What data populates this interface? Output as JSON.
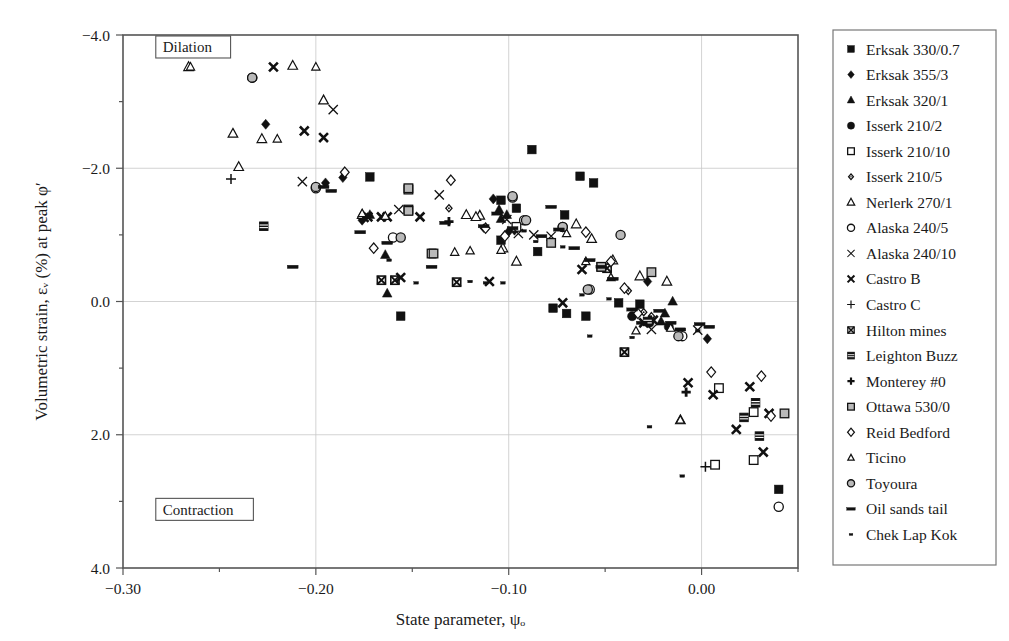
{
  "chart_data": {
    "type": "scatter",
    "title": "",
    "xlabel": "State parameter, ψₒ",
    "ylabel": "Volumetric strain, εᵥ (%) at peak φ′",
    "xlim": [
      -0.3,
      0.05
    ],
    "ylim": [
      -4.0,
      4.0
    ],
    "y_inverted": true,
    "grid": true,
    "legend_position": "right-outside",
    "xticks": [
      -0.3,
      -0.2,
      -0.1,
      0.0
    ],
    "xtick_labels": [
      "−0.30",
      "−0.20",
      "−0.10",
      "0.00"
    ],
    "xminorticks": [
      -0.25,
      -0.15,
      -0.05,
      0.05
    ],
    "yticks": [
      -4.0,
      -2.0,
      0.0,
      2.0,
      4.0
    ],
    "ytick_labels": [
      "−4.0",
      "−2.0",
      "0.0",
      "2.0",
      "4.0"
    ],
    "yminorticks": [
      -3.0,
      -1.0,
      1.0,
      3.0
    ],
    "annotations": [
      {
        "text": "Dilation",
        "x": -0.283,
        "y": -3.82,
        "boxed": true
      },
      {
        "text": "Contraction",
        "x": -0.283,
        "y": 3.12,
        "boxed": true
      }
    ],
    "series": [
      {
        "name": "Erksak 330/0.7",
        "marker": "filled-square",
        "points": [
          [
            -0.172,
            -1.87
          ],
          [
            -0.088,
            -2.28
          ],
          [
            -0.063,
            -1.88
          ],
          [
            -0.056,
            -1.78
          ],
          [
            -0.104,
            -1.52
          ],
          [
            -0.096,
            -1.4
          ],
          [
            -0.071,
            -1.3
          ],
          [
            -0.104,
            -0.92
          ],
          [
            -0.085,
            -0.75
          ],
          [
            -0.077,
            0.1
          ],
          [
            -0.07,
            0.18
          ],
          [
            -0.06,
            0.22
          ],
          [
            -0.043,
            0.02
          ],
          [
            -0.032,
            0.04
          ],
          [
            -0.156,
            0.22
          ],
          [
            0.04,
            2.82
          ]
        ]
      },
      {
        "name": "Erksak 355/3",
        "marker": "filled-diamond",
        "points": [
          [
            -0.226,
            -2.66
          ],
          [
            -0.195,
            -1.78
          ],
          [
            -0.186,
            -1.86
          ],
          [
            -0.176,
            -1.22
          ],
          [
            -0.108,
            -1.54
          ],
          [
            -0.097,
            -1.07
          ],
          [
            -0.028,
            -0.3
          ],
          [
            0.003,
            0.56
          ],
          [
            -0.1,
            -1.05
          ]
        ]
      },
      {
        "name": "Erksak 320/1",
        "marker": "filled-triangle",
        "points": [
          [
            -0.172,
            -1.3
          ],
          [
            -0.164,
            -0.7
          ],
          [
            -0.163,
            -0.12
          ],
          [
            -0.105,
            -1.38
          ],
          [
            -0.104,
            -1.24
          ],
          [
            -0.019,
            0.18
          ],
          [
            -0.015,
            0.0
          ],
          [
            -0.101,
            -1.3
          ],
          [
            -0.021,
            0.3
          ]
        ]
      },
      {
        "name": "Isserk 210/2",
        "marker": "filled-circle",
        "points": [
          [
            -0.036,
            0.22
          ],
          [
            -0.027,
            0.32
          ],
          [
            -0.017,
            0.38
          ]
        ]
      },
      {
        "name": "Isserk 210/10",
        "marker": "open-square",
        "points": [
          [
            -0.152,
            -1.68
          ],
          [
            -0.152,
            -1.38
          ],
          [
            -0.14,
            -0.72
          ],
          [
            -0.096,
            -1.12
          ],
          [
            0.009,
            1.3
          ],
          [
            0.027,
            1.66
          ],
          [
            0.027,
            2.38
          ],
          [
            0.007,
            2.45
          ]
        ]
      },
      {
        "name": "Isserk 210/5",
        "marker": "small-open-diamond",
        "points": [
          [
            -0.17,
            -0.8
          ],
          [
            -0.131,
            -1.4
          ],
          [
            -0.113,
            -1.1
          ],
          [
            -0.102,
            -1.0
          ],
          [
            -0.038,
            -0.16
          ],
          [
            -0.03,
            0.16
          ],
          [
            -0.026,
            0.22
          ]
        ]
      },
      {
        "name": "Nerlerk 270/1",
        "marker": "open-triangle",
        "points": [
          [
            -0.266,
            -3.52
          ],
          [
            -0.243,
            -2.52
          ],
          [
            -0.228,
            -2.44
          ],
          [
            -0.212,
            -3.54
          ],
          [
            -0.196,
            -3.02
          ],
          [
            -0.24,
            -2.02
          ],
          [
            -0.176,
            -1.3
          ],
          [
            -0.122,
            -1.3
          ],
          [
            -0.115,
            -1.29
          ],
          [
            -0.103,
            -0.8
          ],
          [
            -0.096,
            -0.6
          ],
          [
            -0.065,
            -1.16
          ],
          [
            -0.057,
            -0.94
          ],
          [
            -0.046,
            -0.62
          ],
          [
            -0.032,
            -0.38
          ],
          [
            -0.018,
            -0.3
          ],
          [
            -0.011,
            1.78
          ],
          [
            -0.117,
            -1.27
          ]
        ]
      },
      {
        "name": "Alaska 240/5",
        "marker": "open-circle",
        "points": [
          [
            -0.233,
            -3.36
          ],
          [
            -0.2,
            -1.7
          ],
          [
            -0.16,
            -0.96
          ],
          [
            -0.098,
            -1.56
          ],
          [
            -0.092,
            -1.22
          ],
          [
            -0.072,
            -1.12
          ],
          [
            -0.058,
            -0.18
          ],
          [
            -0.01,
            0.52
          ],
          [
            0.04,
            3.08
          ]
        ]
      },
      {
        "name": "Alaska 240/10",
        "marker": "x-thin",
        "points": [
          [
            -0.207,
            -1.8
          ],
          [
            -0.191,
            -2.88
          ],
          [
            -0.157,
            -1.38
          ],
          [
            -0.136,
            -1.6
          ],
          [
            -0.095,
            -1.02
          ],
          [
            -0.087,
            -1.0
          ],
          [
            -0.078,
            -0.98
          ],
          [
            -0.026,
            0.42
          ],
          [
            -0.002,
            0.43
          ],
          [
            -0.101,
            -1.23
          ]
        ]
      },
      {
        "name": "Castro B",
        "marker": "x-bold",
        "points": [
          [
            -0.222,
            -3.52
          ],
          [
            -0.206,
            -2.56
          ],
          [
            -0.196,
            -2.46
          ],
          [
            -0.173,
            -1.27
          ],
          [
            -0.166,
            -1.27
          ],
          [
            -0.163,
            -1.27
          ],
          [
            -0.156,
            -0.36
          ],
          [
            -0.146,
            -1.27
          ],
          [
            -0.11,
            -0.3
          ],
          [
            -0.072,
            0.02
          ],
          [
            -0.062,
            -0.48
          ],
          [
            -0.03,
            0.32
          ],
          [
            -0.025,
            0.28
          ],
          [
            -0.007,
            1.22
          ],
          [
            0.006,
            1.4
          ],
          [
            0.025,
            1.28
          ],
          [
            0.018,
            1.92
          ],
          [
            0.035,
            1.68
          ],
          [
            0.032,
            2.26
          ],
          [
            -0.175,
            -1.26
          ]
        ]
      },
      {
        "name": "Castro C",
        "marker": "plus",
        "points": [
          [
            -0.244,
            -1.84
          ],
          [
            0.002,
            2.48
          ]
        ]
      },
      {
        "name": "Hilton mines",
        "marker": "x-bold-sq",
        "points": [
          [
            -0.166,
            -0.32
          ],
          [
            -0.159,
            -0.32
          ],
          [
            -0.127,
            -0.29
          ],
          [
            -0.052,
            -0.52
          ],
          [
            -0.049,
            -0.5
          ],
          [
            -0.04,
            0.76
          ]
        ]
      },
      {
        "name": "Leighton Buzz",
        "marker": "x-bold-fill",
        "points": [
          [
            -0.227,
            -1.13
          ],
          [
            -0.028,
            0.3
          ],
          [
            0.022,
            1.74
          ],
          [
            0.028,
            1.52
          ],
          [
            0.03,
            2.02
          ]
        ]
      },
      {
        "name": "Monterey #0",
        "marker": "plus-bold",
        "points": [
          [
            -0.131,
            -1.2
          ],
          [
            -0.008,
            1.36
          ]
        ]
      },
      {
        "name": "Ottawa 530/0",
        "marker": "grey-square",
        "points": [
          [
            -0.152,
            -1.7
          ],
          [
            -0.152,
            -1.36
          ],
          [
            -0.139,
            -0.72
          ],
          [
            -0.078,
            -0.88
          ],
          [
            -0.052,
            -0.52
          ],
          [
            -0.026,
            -0.44
          ],
          [
            0.043,
            1.68
          ]
        ]
      },
      {
        "name": "Reid Bedford",
        "marker": "open-diamond",
        "points": [
          [
            -0.185,
            -1.94
          ],
          [
            -0.17,
            -0.8
          ],
          [
            -0.13,
            -1.82
          ],
          [
            -0.112,
            -1.1
          ],
          [
            -0.102,
            -0.98
          ],
          [
            -0.06,
            -1.04
          ],
          [
            -0.047,
            -0.6
          ],
          [
            -0.04,
            -0.2
          ],
          [
            -0.033,
            0.18
          ],
          [
            0.005,
            1.06
          ],
          [
            0.031,
            1.12
          ],
          [
            0.036,
            1.72
          ]
        ]
      },
      {
        "name": "Ticino",
        "marker": "open-triangle-sm",
        "points": [
          [
            -0.265,
            -3.52
          ],
          [
            -0.22,
            -2.44
          ],
          [
            -0.2,
            -3.52
          ],
          [
            -0.176,
            -1.32
          ],
          [
            -0.164,
            -1.28
          ],
          [
            -0.128,
            -0.74
          ],
          [
            -0.12,
            -0.76
          ],
          [
            -0.104,
            -0.77
          ],
          [
            -0.07,
            -1.02
          ],
          [
            -0.06,
            -0.6
          ],
          [
            -0.047,
            -0.36
          ],
          [
            -0.034,
            0.44
          ],
          [
            -0.016,
            0.4
          ],
          [
            -0.011,
            1.78
          ]
        ]
      },
      {
        "name": "Toyoura",
        "marker": "grey-circle",
        "points": [
          [
            -0.233,
            -3.36
          ],
          [
            -0.2,
            -1.72
          ],
          [
            -0.156,
            -0.96
          ],
          [
            -0.098,
            -1.58
          ],
          [
            -0.091,
            -1.22
          ],
          [
            -0.072,
            -1.12
          ],
          [
            -0.059,
            -0.18
          ],
          [
            -0.042,
            -1.0
          ],
          [
            -0.012,
            0.52
          ]
        ]
      },
      {
        "name": "Oil sands tail",
        "marker": "dash-bold",
        "points": [
          [
            -0.212,
            -0.52
          ],
          [
            -0.196,
            -1.72
          ],
          [
            -0.192,
            -1.66
          ],
          [
            -0.177,
            -1.04
          ],
          [
            -0.163,
            -0.88
          ],
          [
            -0.14,
            -0.52
          ],
          [
            -0.133,
            -1.18
          ],
          [
            -0.113,
            -1.13
          ],
          [
            -0.106,
            -1.32
          ],
          [
            -0.098,
            -1.1
          ],
          [
            -0.083,
            -0.98
          ],
          [
            -0.078,
            -1.42
          ],
          [
            -0.074,
            -1.08
          ],
          [
            -0.066,
            -0.8
          ],
          [
            -0.058,
            -0.62
          ],
          [
            -0.052,
            -0.52
          ],
          [
            -0.046,
            -0.34
          ],
          [
            -0.036,
            0.12
          ],
          [
            -0.031,
            0.32
          ],
          [
            -0.022,
            0.14
          ],
          [
            -0.016,
            0.32
          ],
          [
            -0.011,
            0.42
          ],
          [
            -0.001,
            0.34
          ],
          [
            0.004,
            0.38
          ]
        ]
      },
      {
        "name": "Chek Lap Kok",
        "marker": "dot-small",
        "points": [
          [
            -0.162,
            -0.62
          ],
          [
            -0.148,
            -0.28
          ],
          [
            -0.12,
            -0.3
          ],
          [
            -0.112,
            -0.28
          ],
          [
            -0.103,
            -0.28
          ],
          [
            -0.092,
            -1.06
          ],
          [
            -0.086,
            -0.9
          ],
          [
            -0.072,
            -0.82
          ],
          [
            -0.062,
            -0.1
          ],
          [
            -0.058,
            0.52
          ],
          [
            -0.036,
            0.54
          ],
          [
            -0.027,
            1.88
          ],
          [
            -0.01,
            2.62
          ],
          [
            -0.002,
            0.44
          ],
          [
            -0.048,
            -0.04
          ]
        ]
      }
    ]
  },
  "legend": {
    "items": [
      {
        "label": "Erksak 330/0.7",
        "marker": "filled-square"
      },
      {
        "label": "Erksak 355/3",
        "marker": "filled-diamond"
      },
      {
        "label": "Erksak 320/1",
        "marker": "filled-triangle"
      },
      {
        "label": "Isserk 210/2",
        "marker": "filled-circle"
      },
      {
        "label": "Isserk 210/10",
        "marker": "open-square"
      },
      {
        "label": "Isserk 210/5",
        "marker": "small-open-diamond"
      },
      {
        "label": "Nerlerk 270/1",
        "marker": "open-triangle"
      },
      {
        "label": "Alaska 240/5",
        "marker": "open-circle"
      },
      {
        "label": "Alaska 240/10",
        "marker": "x-thin"
      },
      {
        "label": "Castro B",
        "marker": "x-bold"
      },
      {
        "label": "Castro C",
        "marker": "plus"
      },
      {
        "label": "Hilton mines",
        "marker": "x-bold-sq"
      },
      {
        "label": "Leighton Buzz",
        "marker": "x-bold-fill"
      },
      {
        "label": "Monterey #0",
        "marker": "plus-bold"
      },
      {
        "label": "Ottawa 530/0",
        "marker": "grey-square"
      },
      {
        "label": "Reid Bedford",
        "marker": "open-diamond"
      },
      {
        "label": "Ticino",
        "marker": "open-triangle-sm"
      },
      {
        "label": "Toyoura",
        "marker": "grey-circle"
      },
      {
        "label": "Oil sands tail",
        "marker": "dash-bold"
      },
      {
        "label": "Chek Lap Kok",
        "marker": "dot-small"
      }
    ]
  },
  "colors": {
    "marker": "#111111",
    "grey_fill": "#b9b9b9",
    "frame": "#555555",
    "grid": "#c8c8c8",
    "background": "#ffffff"
  }
}
